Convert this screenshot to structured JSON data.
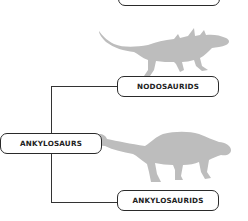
{
  "diagram": {
    "type": "cladogram",
    "nodes": [
      {
        "id": "top",
        "label": ""
      },
      {
        "id": "nodosaurids",
        "label": "NODOSAURIDS"
      },
      {
        "id": "ankylosaurs",
        "label": "ANKYLOSAURS"
      },
      {
        "id": "ankylosaurids",
        "label": "ANKYLOSAURIDS"
      }
    ],
    "edges": [
      {
        "from": "ankylosaurs",
        "to": "nodosaurids"
      },
      {
        "from": "ankylosaurs",
        "to": "ankylosaurids"
      }
    ],
    "silhouettes": [
      {
        "name": "nodosaur-silhouette",
        "color": "#bdbdbd"
      },
      {
        "name": "ankylosaur-silhouette",
        "color": "#bdbdbd"
      }
    ],
    "colors": {
      "line": "#333333",
      "box_border": "#2a2a2a",
      "silhouette": "#bdbdbd",
      "background": "#ffffff"
    }
  }
}
